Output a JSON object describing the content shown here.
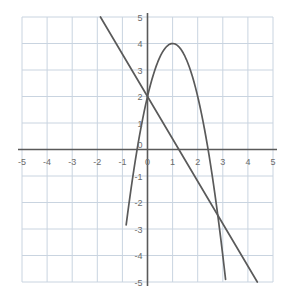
{
  "chart_data": {
    "type": "line",
    "title": "",
    "xlabel": "",
    "ylabel": "",
    "xlim": [
      -5,
      5
    ],
    "ylim": [
      -5,
      5
    ],
    "grid": true,
    "grid_step": 1,
    "legend": "none",
    "x_tick_labels": [
      "-5",
      "-4",
      "-3",
      "-2",
      "-1",
      "0",
      "1",
      "2",
      "3",
      "4",
      "5"
    ],
    "y_tick_labels": [
      "5",
      "4",
      "3",
      "2",
      "1",
      "0",
      "-1",
      "-2",
      "-3",
      "-4",
      "-5"
    ],
    "x_ticks": [
      -5,
      -4,
      -3,
      -2,
      -1,
      0,
      1,
      2,
      3,
      4,
      5
    ],
    "y_ticks": [
      5,
      4,
      3,
      2,
      1,
      0,
      -1,
      -2,
      -3,
      -4,
      -5
    ],
    "series": [
      {
        "name": "parabola",
        "kind": "quadratic",
        "equation": "y = -2(x - 1)^2 + 4",
        "vertex": [
          1,
          4
        ],
        "y_intercept": 2,
        "x_roots": [
          -0.41,
          2.41
        ],
        "color": "#5a5a5a",
        "points": [
          [
            -0.75,
            -2.13
          ],
          [
            -0.5,
            -0.5
          ],
          [
            -0.25,
            0.88
          ],
          [
            0,
            2
          ],
          [
            0.25,
            2.88
          ],
          [
            0.5,
            3.5
          ],
          [
            0.75,
            3.88
          ],
          [
            1,
            4
          ],
          [
            1.25,
            3.88
          ],
          [
            1.5,
            3.5
          ],
          [
            1.75,
            2.88
          ],
          [
            2,
            2
          ],
          [
            2.25,
            0.88
          ],
          [
            2.5,
            -0.5
          ],
          [
            2.75,
            -2.13
          ],
          [
            3,
            -4
          ],
          [
            3.2,
            -5.68
          ]
        ]
      },
      {
        "name": "line",
        "kind": "linear",
        "equation": "y = -1.6x + 2",
        "slope": -1.6,
        "y_intercept": 2,
        "x_root": 1.25,
        "color": "#5a5a5a",
        "points": [
          [
            -1.875,
            5
          ],
          [
            0,
            2
          ],
          [
            2.5,
            -2
          ],
          [
            4.375,
            -5
          ]
        ]
      }
    ],
    "colors": {
      "grid": "#c9d4e0",
      "axis": "#5a5a5a",
      "curve": "#5a5a5a",
      "tick_text": "#6b6b6b",
      "background": "#ffffff"
    }
  }
}
